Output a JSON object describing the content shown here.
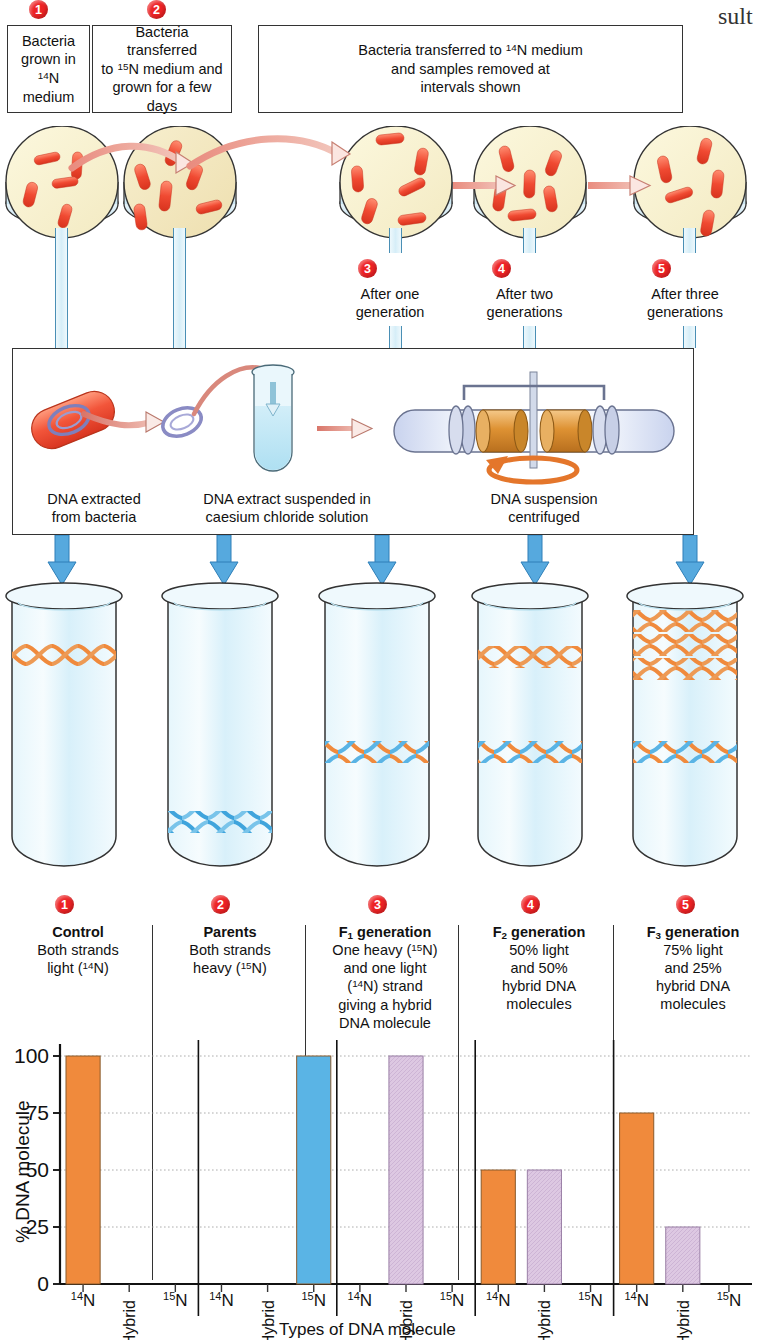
{
  "page": {
    "cut_text_top_right": "sult",
    "width": 759,
    "height": 1342
  },
  "colors": {
    "bullet_red": "#ED2224",
    "light_dna_orange": "#F08A3C",
    "heavy_dna_blue": "#5AB4E5",
    "hybrid_purple": "#D9C2DE",
    "arrow_blue": "#56A9DE",
    "dish_agar": "#F7F0CE",
    "bacteria_red": "#F04A32",
    "tube_glass": "#DFF2FA",
    "rotor_orange": "#E79A3C"
  },
  "steps": [
    {
      "id": "1",
      "bullet": "❶",
      "caption": [
        "Bacteria",
        "grown in",
        "¹⁴N medium"
      ]
    },
    {
      "id": "2",
      "bullet": "❷",
      "caption": [
        "Bacteria transferred",
        "to ¹⁵N medium and",
        "grown for a few days"
      ]
    },
    {
      "id": "3",
      "bullet": "❸",
      "caption": [
        "Bacteria transferred to ¹⁴N medium",
        "and samples removed at",
        "intervals shown"
      ]
    }
  ],
  "top_boxes": [
    {
      "name": "box-1",
      "lines": [
        "Bacteria",
        "grown in",
        "14N medium"
      ],
      "sup_line": 2,
      "sup_text": "14"
    },
    {
      "name": "box-2",
      "lines": [
        "Bacteria transferred",
        "to 15N medium and",
        "grown for a few days"
      ]
    },
    {
      "name": "box-3",
      "lines": [
        "Bacteria transferred to 14N medium",
        "and samples removed at",
        "intervals shown"
      ]
    }
  ],
  "bullets_top": [
    "1",
    "2"
  ],
  "dish_labels": [
    {
      "bullet": "3",
      "lines": [
        "After one",
        "generation"
      ]
    },
    {
      "bullet": "4",
      "lines": [
        "After two",
        "generations"
      ]
    },
    {
      "bullet": "5",
      "lines": [
        "After three",
        "generations"
      ]
    }
  ],
  "process_panel": {
    "captions": [
      [
        "DNA extracted",
        "from bacteria"
      ],
      [
        "DNA extract suspended in",
        "caesium chloride solution"
      ],
      [
        "DNA suspension",
        "centrifuged"
      ]
    ]
  },
  "tubes": [
    {
      "id": "1",
      "bands": [
        {
          "type": "light",
          "y_pct": 22
        }
      ]
    },
    {
      "id": "2",
      "bands": [
        {
          "type": "heavy",
          "y_pct": 79
        }
      ]
    },
    {
      "id": "3",
      "bands": [
        {
          "type": "hybrid",
          "y_pct": 56
        }
      ]
    },
    {
      "id": "4",
      "bands": [
        {
          "type": "light",
          "y_pct": 24
        },
        {
          "type": "hybrid",
          "y_pct": 56
        }
      ]
    },
    {
      "id": "5",
      "bands": [
        {
          "type": "light",
          "y_pct": 12
        },
        {
          "type": "light",
          "y_pct": 22
        },
        {
          "type": "light",
          "y_pct": 32
        },
        {
          "type": "hybrid",
          "y_pct": 56
        }
      ]
    }
  ],
  "columns": [
    {
      "bullet": "1",
      "heading": "Control",
      "heading_parts": null,
      "body": [
        "Both strands",
        "light (14N)"
      ]
    },
    {
      "bullet": "2",
      "heading": "Parents",
      "heading_parts": null,
      "body": [
        "Both strands",
        "heavy (15N)"
      ]
    },
    {
      "bullet": "3",
      "heading": "F1 generation",
      "heading_parts": {
        "f": "F",
        "sub": "1",
        "rest": " generation"
      },
      "body": [
        "One heavy (15N)",
        "and one light",
        "(14N) strand",
        "giving a hybrid",
        "DNA molecule"
      ]
    },
    {
      "bullet": "4",
      "heading": "F2 generation",
      "heading_parts": {
        "f": "F",
        "sub": "2",
        "rest": " generation"
      },
      "body": [
        "50% light",
        "and 50%",
        "hybrid DNA",
        "molecules"
      ]
    },
    {
      "bullet": "5",
      "heading": "F3 generation",
      "heading_parts": {
        "f": "F",
        "sub": "3",
        "rest": " generation"
      },
      "body": [
        "75% light",
        "and 25%",
        "hybrid DNA",
        "molecules"
      ]
    }
  ],
  "chart_data": {
    "type": "bar",
    "title": "",
    "xlabel": "Types of DNA molecule",
    "ylabel": "% DNA molecule",
    "ylim": [
      0,
      100
    ],
    "yticks": [
      0,
      25,
      50,
      75,
      100
    ],
    "ytick_labels": [
      "0",
      "25",
      "50",
      "75",
      "100"
    ],
    "grid": true,
    "legend": "none",
    "group_labels": [
      "Control",
      "Parents",
      "F1 generation",
      "F2 generation",
      "F3 generation"
    ],
    "categories": [
      "14N",
      "Hybrid",
      "15N"
    ],
    "category_labels": [
      "14N",
      "Hybrid",
      "15N"
    ],
    "groups": [
      {
        "group": "1",
        "values": [
          100,
          0,
          0
        ],
        "colors": [
          "#F08A3C",
          "#D9C2DE",
          "#5AB4E5"
        ]
      },
      {
        "group": "2",
        "values": [
          0,
          0,
          100
        ],
        "colors": [
          "#F08A3C",
          "#D9C2DE",
          "#5AB4E5"
        ]
      },
      {
        "group": "3",
        "values": [
          0,
          100,
          0
        ],
        "colors": [
          "#F08A3C",
          "#D9C2DE",
          "#5AB4E5"
        ]
      },
      {
        "group": "4",
        "values": [
          50,
          50,
          0
        ],
        "colors": [
          "#F08A3C",
          "#D9C2DE",
          "#5AB4E5"
        ]
      },
      {
        "group": "5",
        "values": [
          75,
          25,
          0
        ],
        "colors": [
          "#F08A3C",
          "#D9C2DE",
          "#5AB4E5"
        ]
      }
    ]
  }
}
